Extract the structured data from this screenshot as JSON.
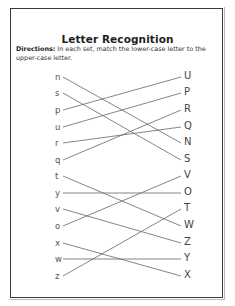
{
  "worksheet": {
    "title": "Letter Recognition",
    "directions_label": "Directions:",
    "directions_text": " In each set, match the lower-case letter to the upper-case letter.",
    "lowercase": [
      "n",
      "s",
      "p",
      "u",
      "r",
      "q",
      "t",
      "y",
      "v",
      "o",
      "x",
      "w",
      "z"
    ],
    "uppercase": [
      "U",
      "P",
      "R",
      "Q",
      "N",
      "S",
      "V",
      "O",
      "T",
      "W",
      "Z",
      "Y",
      "X"
    ],
    "matches": [
      {
        "from": "n",
        "to": "N"
      },
      {
        "from": "s",
        "to": "S"
      },
      {
        "from": "p",
        "to": "U"
      },
      {
        "from": "u",
        "to": "P"
      },
      {
        "from": "r",
        "to": "Q"
      },
      {
        "from": "q",
        "to": "R"
      },
      {
        "from": "t",
        "to": "W"
      },
      {
        "from": "y",
        "to": "O"
      },
      {
        "from": "v",
        "to": "Z"
      },
      {
        "from": "o",
        "to": "V"
      },
      {
        "from": "x",
        "to": "X"
      },
      {
        "from": "w",
        "to": "Y"
      },
      {
        "from": "z",
        "to": "T"
      }
    ]
  },
  "colors": {
    "border": "#3a3a3a",
    "line": "#666666",
    "text": "#222222"
  }
}
